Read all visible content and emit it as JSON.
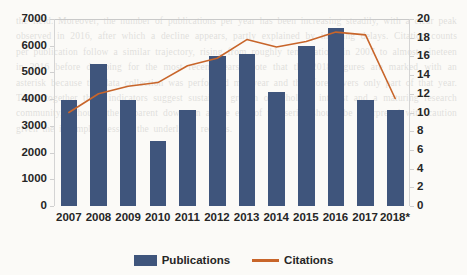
{
  "background_text": "the field. Moreover, the number of publications per year has been increasing steadily, with a clear peak observed in 2016, after which a decline appears, partly explained by indexing delays. Citation counts per publication follow a similar trajectory, rising from roughly ten citations in 2007 to almost nineteen in 2016 before dropping for the most recent years. Note that the 2018 figures are marked with an asterisk because the data collection was performed mid-year and therefore covers only part of that year. Taken together these indicators suggest sustained growth of scholarly interest and a maturing research community, although the apparent downturn at the end of the series should be interpreted with caution given the incompleteness of the underlying records.",
  "chart_data": {
    "type": "bar",
    "title": "",
    "xlabel": "",
    "ylabel": "",
    "grid": false,
    "legend_position": "bottom",
    "categories": [
      "2007",
      "2008",
      "2009",
      "2010",
      "2011",
      "2012",
      "2013",
      "2014",
      "2015",
      "2016",
      "2017",
      "2018*"
    ],
    "axes": {
      "left": {
        "label": "",
        "min": 0,
        "max": 7000,
        "step": 1000,
        "ticks": [
          "0",
          "1000",
          "2000",
          "3000",
          "4000",
          "5000",
          "6000",
          "7000"
        ]
      },
      "right": {
        "label": "",
        "min": 0,
        "max": 20,
        "step": 2,
        "ticks": [
          "0",
          "2",
          "4",
          "6",
          "8",
          "10",
          "12",
          "14",
          "16",
          "18",
          "20"
        ]
      }
    },
    "series": [
      {
        "name": "Publications",
        "type": "bar",
        "axis": "left",
        "color": "#3f557c",
        "values": [
          3950,
          5300,
          3950,
          2450,
          3600,
          5600,
          5700,
          4250,
          6000,
          6650,
          3950,
          3600
        ]
      },
      {
        "name": "Citations",
        "type": "line",
        "axis": "right",
        "color": "#c8652a",
        "values": [
          10.0,
          12.0,
          12.8,
          13.2,
          15.0,
          15.8,
          17.8,
          17.0,
          17.6,
          18.6,
          18.3,
          11.5
        ]
      }
    ]
  },
  "legend": [
    {
      "label": "Publications",
      "marker": "bar-swatch",
      "color": "#3f557c"
    },
    {
      "label": "Citations",
      "marker": "line-swatch",
      "color": "#c8652a"
    }
  ]
}
